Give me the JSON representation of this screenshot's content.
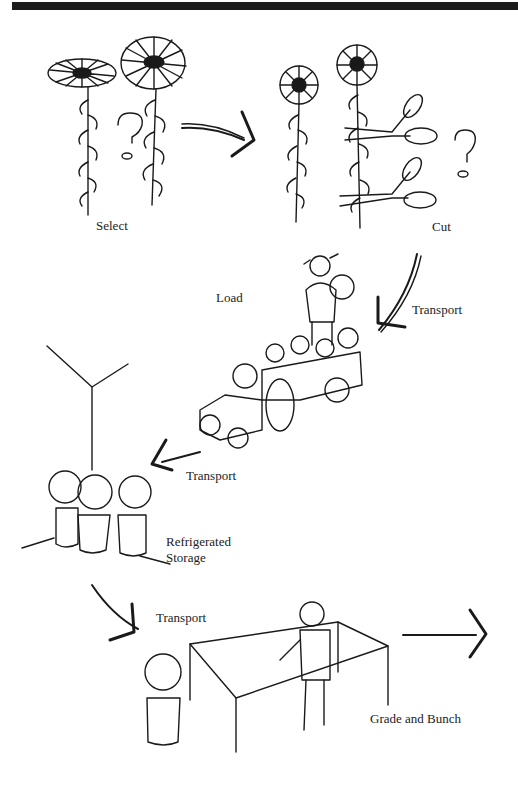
{
  "diagram": {
    "type": "process-flow illustration",
    "steps": [
      {
        "id": "select",
        "label": "Select"
      },
      {
        "id": "cut",
        "label": "Cut"
      },
      {
        "id": "transport1",
        "label": "Transport"
      },
      {
        "id": "load",
        "label": "Load"
      },
      {
        "id": "transport2",
        "label": "Transport"
      },
      {
        "id": "storage",
        "label_line1": "Refrigerated",
        "label_line2": "Storage"
      },
      {
        "id": "transport3",
        "label": "Transport"
      },
      {
        "id": "grade",
        "label": "Grade and Bunch"
      }
    ],
    "colors": {
      "ink": "#1a1a1a",
      "background": "#ffffff",
      "top_bar": "#1c1c1c"
    }
  }
}
